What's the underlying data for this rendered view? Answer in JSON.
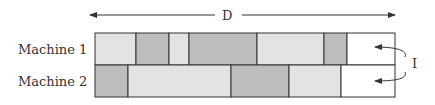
{
  "diagram": {
    "type": "gantt-schedule",
    "span_label": "D",
    "idle_label": "I",
    "machines": [
      {
        "label": "Machine 1",
        "blocks": [
          {
            "start": 95,
            "end": 136,
            "shade": "light"
          },
          {
            "start": 136,
            "end": 169,
            "shade": "dark"
          },
          {
            "start": 169,
            "end": 189,
            "shade": "light"
          },
          {
            "start": 189,
            "end": 257,
            "shade": "dark"
          },
          {
            "start": 257,
            "end": 324,
            "shade": "light"
          },
          {
            "start": 324,
            "end": 347,
            "shade": "dark"
          },
          {
            "start": 347,
            "end": 395,
            "shade": "idle"
          }
        ]
      },
      {
        "label": "Machine 2",
        "blocks": [
          {
            "start": 95,
            "end": 128,
            "shade": "dark"
          },
          {
            "start": 128,
            "end": 231,
            "shade": "light"
          },
          {
            "start": 231,
            "end": 289,
            "shade": "dark"
          },
          {
            "start": 289,
            "end": 341,
            "shade": "light"
          },
          {
            "start": 341,
            "end": 395,
            "shade": "idle"
          }
        ]
      }
    ],
    "colors": {
      "light": "#e3e3e3",
      "dark": "#bdbdbd",
      "idle": "#ffffff",
      "stroke": "#333333"
    }
  }
}
